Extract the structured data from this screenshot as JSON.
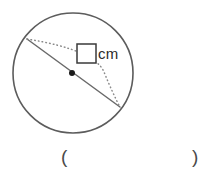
{
  "figure": {
    "name": "circle-with-diameter-and-arc",
    "colors": {
      "background": "#ffffff",
      "circle_stroke": "#5c5c5c",
      "line_stroke": "#6a6a6a",
      "dotted_stroke": "#8a8a8a",
      "center_dot": "#1a1a1a",
      "box_stroke": "#3a3a3a",
      "text": "#2b2b2b",
      "paren": "#4a4a4a"
    },
    "geometry": {
      "circle_center_x": 73,
      "circle_center_y": 73,
      "circle_radius": 60,
      "center_dot_x": 72,
      "center_dot_y": 73,
      "center_dot_radius": 3,
      "diameter_start_x": 27,
      "diameter_start_y": 39,
      "diameter_end_x": 120,
      "diameter_end_y": 107
    },
    "answer_box": {
      "x": 77,
      "y": 44,
      "width": 19,
      "height": 19,
      "value": ""
    }
  },
  "labels": {
    "unit": "cm",
    "paren_left": "(",
    "paren_right": ")",
    "answer_blank": ""
  }
}
